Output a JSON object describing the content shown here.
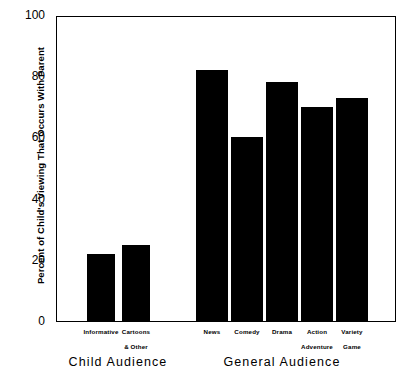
{
  "chart_data": {
    "type": "bar",
    "title": "",
    "subtitle": "",
    "xlabel": "",
    "ylabel": "Percent of Child's Viewing That Occurs With Parent",
    "ylim": [
      0,
      100
    ],
    "yticks": [
      0,
      20,
      40,
      60,
      80,
      100
    ],
    "ytick_labels": [
      "0",
      "20",
      "40",
      "60",
      "80",
      "100"
    ],
    "grid": false,
    "legend": null,
    "bar_color": "#000000",
    "categories": [
      "Informative",
      "Cartoons & Other",
      "News",
      "Comedy",
      "Drama",
      "Action Adventure",
      "Variety Game"
    ],
    "values": [
      22,
      25,
      82,
      60,
      78,
      70,
      73
    ],
    "groups": [
      {
        "label": "Child Audience",
        "categories": [
          "Informative",
          "Cartoons & Other"
        ],
        "values": [
          22,
          25
        ]
      },
      {
        "label": "General Audience",
        "categories": [
          "News",
          "Comedy",
          "Drama",
          "Action Adventure",
          "Variety Game"
        ],
        "values": [
          82,
          60,
          78,
          70,
          73
        ]
      }
    ],
    "bars": [
      {
        "label_line1": "Informative",
        "label_line2": "",
        "value": 22,
        "x": 87,
        "width": 28
      },
      {
        "label_line1": "Cartoons",
        "label_line2": "& Other",
        "value": 25,
        "x": 122,
        "width": 28
      },
      {
        "label_line1": "News",
        "label_line2": "",
        "value": 82,
        "x": 196,
        "width": 32
      },
      {
        "label_line1": "Comedy",
        "label_line2": "",
        "value": 60,
        "x": 231,
        "width": 32
      },
      {
        "label_line1": "Drama",
        "label_line2": "",
        "value": 78,
        "x": 266,
        "width": 32
      },
      {
        "label_line1": "Action",
        "label_line2": "Adventure",
        "value": 70,
        "x": 301,
        "width": 32
      },
      {
        "label_line1": "Variety",
        "label_line2": "Game",
        "value": 73,
        "x": 336,
        "width": 32
      }
    ],
    "group_titles": [
      {
        "text": "Child Audience",
        "center_x": 118
      },
      {
        "text": "General Audience",
        "center_x": 282
      }
    ]
  }
}
